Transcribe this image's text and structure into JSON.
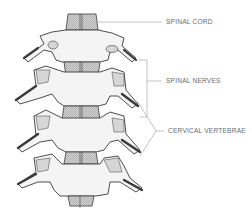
{
  "figure": {
    "labels": [
      {
        "id": "spinal-cord",
        "text": "SPINAL CORD",
        "x": 166,
        "y": 18
      },
      {
        "id": "spinal-nerves",
        "text": "SPINAL NERVES",
        "x": 166,
        "y": 77
      },
      {
        "id": "cervical-vertebrae",
        "text": "CERVICAL VERTEBRAE",
        "x": 168,
        "y": 128
      }
    ],
    "colors": {
      "line": "#3a3a3a",
      "bone_fill": "#f4f4f4",
      "shade": "#b9b9b9",
      "leader": "#9a9a9a",
      "label_text": "#6b6b6b"
    }
  }
}
